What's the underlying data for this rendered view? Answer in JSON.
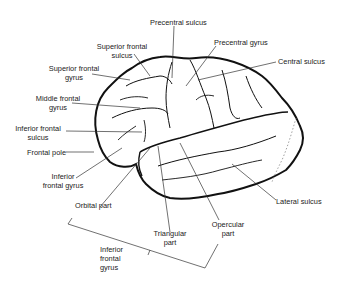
{
  "diagram": {
    "colors": {
      "outline": "#111111",
      "leader": "#333333",
      "text": "#222222",
      "dotted": "#888888"
    },
    "labels": {
      "precentral_sulcus": "Precentral sulcus",
      "precentral_gyrus": "Precentral gyrus",
      "central_sulcus": "Central sulcus",
      "superior_frontal_sulcus_1": "Superior frontal",
      "superior_frontal_sulcus_2": "sulcus",
      "superior_frontal_gyrus_1": "Superior frontal",
      "superior_frontal_gyrus_2": "gyrus",
      "middle_frontal_gyrus_1": "Middle frontal",
      "middle_frontal_gyrus_2": "gyrus",
      "inferior_frontal_sulcus_1": "Inferior frontal",
      "inferior_frontal_sulcus_2": "sulcus",
      "frontal_pole": "Frontal pole",
      "inferior_frontal_gyrus_1": "Inferior",
      "inferior_frontal_gyrus_2": "frontal gyrus",
      "orbital_part": "Orbital part",
      "triangular_part_1": "Triangular",
      "triangular_part_2": "part",
      "opercular_part_1": "Opercular",
      "opercular_part_2": "part",
      "lateral_sulcus": "Lateral sulcus",
      "ifg_bracket_1": "Inferior",
      "ifg_bracket_2": "frontal",
      "ifg_bracket_3": "gyrus"
    }
  }
}
